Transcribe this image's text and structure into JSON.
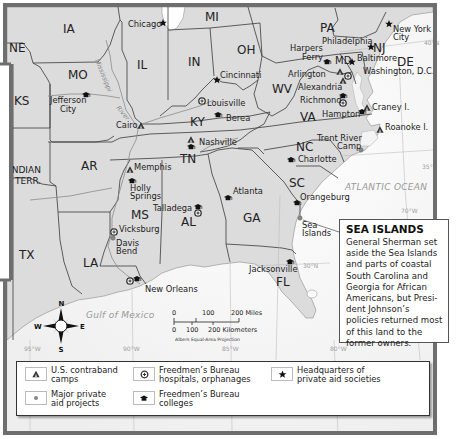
{
  "map": {
    "title_region": "Reconstruction-era South — Freedmen's aid sites",
    "states": [
      {
        "id": "IA",
        "label": "IA",
        "x": 63,
        "y": 33
      },
      {
        "id": "NE",
        "label": "NE",
        "x": 5,
        "y": 52
      },
      {
        "id": "MO",
        "label": "MO",
        "x": 70,
        "y": 79
      },
      {
        "id": "KS",
        "label": "KS",
        "x": 16,
        "y": 105
      },
      {
        "id": "IL",
        "label": "IL",
        "x": 135,
        "y": 69
      },
      {
        "id": "IN",
        "label": "IN",
        "x": 188,
        "y": 66
      },
      {
        "id": "MI",
        "label": "MI",
        "x": 205,
        "y": 21
      },
      {
        "id": "OH",
        "label": "OH",
        "x": 237,
        "y": 53
      },
      {
        "id": "PA",
        "label": "PA",
        "x": 318,
        "y": 32
      },
      {
        "id": "NJ",
        "label": "NJ",
        "x": 373,
        "y": 52
      },
      {
        "id": "MD",
        "label": "MD",
        "x": 333,
        "y": 64
      },
      {
        "id": "DE",
        "label": "DE",
        "x": 397,
        "y": 66
      },
      {
        "id": "WV",
        "label": "WV",
        "x": 272,
        "y": 91
      },
      {
        "id": "VA",
        "label": "VA",
        "x": 300,
        "y": 120
      },
      {
        "id": "KY",
        "label": "KY",
        "x": 190,
        "y": 125
      },
      {
        "id": "TN",
        "label": "TN",
        "x": 178,
        "y": 163
      },
      {
        "id": "NC",
        "label": "NC",
        "x": 295,
        "y": 151
      },
      {
        "id": "SC",
        "label": "SC",
        "x": 287,
        "y": 187
      },
      {
        "id": "AR",
        "label": "AR",
        "x": 82,
        "y": 170
      },
      {
        "id": "MS",
        "label": "MS",
        "x": 130,
        "y": 219
      },
      {
        "id": "AL",
        "label": "AL",
        "x": 180,
        "y": 225
      },
      {
        "id": "GA",
        "label": "GA",
        "x": 241,
        "y": 222
      },
      {
        "id": "FL",
        "label": "FL",
        "x": 275,
        "y": 286
      },
      {
        "id": "LA",
        "label": "LA",
        "x": 84,
        "y": 267
      },
      {
        "id": "TX",
        "label": "TX",
        "x": 19,
        "y": 259
      },
      {
        "id": "INDIAN_TERR",
        "label": "INDIAN",
        "label2": "TERR.",
        "x": 8,
        "y": 173
      }
    ],
    "cities": [
      {
        "name": "Chicago",
        "lines": [
          "Chicago"
        ],
        "x": 128,
        "y": 27,
        "symbol": "star"
      },
      {
        "name": "Cincinnati",
        "lines": [
          "Cincinnati"
        ],
        "x": 219,
        "y": 78,
        "symbol": "star"
      },
      {
        "name": "Louisville",
        "lines": [
          "Louisville"
        ],
        "x": 207,
        "y": 106,
        "symbol": "circle-plus"
      },
      {
        "name": "Berea",
        "lines": [
          "Berea"
        ],
        "x": 225,
        "y": 121,
        "symbol": "mortarboard"
      },
      {
        "name": "Nashville",
        "lines": [
          "Nashville"
        ],
        "x": 199,
        "y": 145,
        "symbol": "triangle"
      },
      {
        "name": "Jefferson City",
        "lines": [
          "Jefferson",
          "City"
        ],
        "x": 50,
        "y": 103,
        "symbol": "mortarboard"
      },
      {
        "name": "Cairo",
        "lines": [
          "Cairo"
        ],
        "x": 117,
        "y": 128,
        "symbol": "triangle"
      },
      {
        "name": "Memphis",
        "lines": [
          "Memphis"
        ],
        "x": 134,
        "y": 170,
        "symbol": "triangle"
      },
      {
        "name": "Holly Springs",
        "lines": [
          "Holly",
          "Springs"
        ],
        "x": 130,
        "y": 190,
        "symbol": "mortarboard"
      },
      {
        "name": "Talladega",
        "lines": [
          "Talladega"
        ],
        "x": 153,
        "y": 211,
        "symbol": "mortarboard-plus"
      },
      {
        "name": "Vicksburg",
        "lines": [
          "Vicksburg"
        ],
        "x": 119,
        "y": 232,
        "symbol": "circle-plus"
      },
      {
        "name": "Davis Bend",
        "lines": [
          "Davis",
          "Bend"
        ],
        "x": 116,
        "y": 246,
        "symbol": "dot"
      },
      {
        "name": "New Orleans",
        "lines": [
          "New Orleans"
        ],
        "x": 145,
        "y": 292,
        "symbol": "circle-plus-mortarboard"
      },
      {
        "name": "Atlanta",
        "lines": [
          "Atlanta"
        ],
        "x": 233,
        "y": 195,
        "symbol": "mortarboard"
      },
      {
        "name": "Orangeburg",
        "lines": [
          "Orangeburg"
        ],
        "x": 299,
        "y": 201,
        "symbol": "mortarboard"
      },
      {
        "name": "Sea Islands",
        "lines": [
          "Sea",
          "Islands"
        ],
        "x": 302,
        "y": 228,
        "symbol": "dot"
      },
      {
        "name": "Charlotte",
        "lines": [
          "Charlotte"
        ],
        "x": 298,
        "y": 162,
        "symbol": "mortarboard"
      },
      {
        "name": "Jacksonville",
        "lines": [
          "Jacksonville"
        ],
        "x": 249,
        "y": 272,
        "symbol": "mortarboard"
      },
      {
        "name": "Trent River Camp",
        "lines": [
          "Trent River",
          "Camp"
        ],
        "x": 317,
        "y": 143,
        "symbol": "dot"
      },
      {
        "name": "Roanoke I.",
        "lines": [
          "Roanoke I."
        ],
        "x": 385,
        "y": 129,
        "symbol": "triangle"
      },
      {
        "name": "Craney I.",
        "lines": [
          "Craney I."
        ],
        "x": 370,
        "y": 108,
        "symbol": "triangle"
      },
      {
        "name": "Hampton",
        "lines": [
          "Hampton"
        ],
        "x": 296,
        "y": 116,
        "symbol": "mortarboard"
      },
      {
        "name": "Richmond",
        "lines": [
          "Richmond"
        ],
        "x": 300,
        "y": 102,
        "symbol": "mortarboard-plus"
      },
      {
        "name": "Alexandria",
        "lines": [
          "Alexandria"
        ],
        "x": 298,
        "y": 89,
        "symbol": "triangle"
      },
      {
        "name": "Arlington",
        "lines": [
          "Arlington"
        ],
        "x": 288,
        "y": 76,
        "symbol": "triangle"
      },
      {
        "name": "Harpers Ferry",
        "lines": [
          "Harpers",
          "Ferry"
        ],
        "x": 290,
        "y": 52,
        "symbol": "mortarboard"
      },
      {
        "name": "Washington, D.C.",
        "lines": [
          "Washington, D.C."
        ],
        "x": 363,
        "y": 74,
        "symbol": "circle-plus"
      },
      {
        "name": "Baltimore",
        "lines": [
          "Baltimore"
        ],
        "x": 357,
        "y": 61,
        "symbol": "star"
      },
      {
        "name": "Philadelphia",
        "lines": [
          "Philadelphia"
        ],
        "x": 322,
        "y": 44,
        "symbol": "star"
      },
      {
        "name": "New York City",
        "lines": [
          "New York",
          "City"
        ],
        "x": 393,
        "y": 32,
        "symbol": "star"
      }
    ],
    "water_labels": [
      {
        "text": "ATLANTIC OCEAN",
        "x": 345,
        "y": 190
      },
      {
        "text": "Gulf of Mexico",
        "x": 86,
        "y": 318
      }
    ],
    "river_label": {
      "line1": "Mississippi",
      "line2": "River"
    },
    "gridlines": [
      {
        "label": "40°N",
        "x": 424,
        "y": 45
      },
      {
        "label": "35°N",
        "x": 422,
        "y": 169
      },
      {
        "label": "30°N",
        "x": 303,
        "y": 268
      },
      {
        "label": "70°W",
        "x": 401,
        "y": 213
      },
      {
        "label": "95°W",
        "x": 24,
        "y": 351
      },
      {
        "label": "90°W",
        "x": 123,
        "y": 351
      },
      {
        "label": "85°W",
        "x": 222,
        "y": 351
      },
      {
        "label": "80°W",
        "x": 330,
        "y": 351
      }
    ],
    "compass": {
      "n": "N",
      "s": "S",
      "e": "E",
      "w": "W"
    },
    "scale": {
      "miles_ticks": [
        "0",
        "100",
        "200 Miles"
      ],
      "km_ticks": [
        "0",
        "100",
        "200 Kilometers"
      ],
      "projection": "Albers Equal-Area Projection"
    }
  },
  "callout": {
    "title": "SEA ISLANDS",
    "body": "General Sherman set aside the Sea Islands and parts of coastal South Carolina and Georgia for African Americans, but Presi-dent Johnson’s policies returned most of this land to the former owners."
  },
  "legend": {
    "items": [
      {
        "symbol": "triangle-icon",
        "label": "U.S. contraband\ncamps"
      },
      {
        "symbol": "dot-icon",
        "label": "Major private\naid projects"
      },
      {
        "symbol": "circle-plus-icon",
        "label": "Freedmen’s Bureau\nhospitals, orphanages"
      },
      {
        "symbol": "mortarboard-icon",
        "label": "Freedmen’s Bureau\ncolleges"
      },
      {
        "symbol": "star-icon",
        "label": "Headquarters of\nprivate aid societies"
      }
    ]
  },
  "colors": {
    "land": "#d9d9d9",
    "land_light": "#e4e4e4",
    "water": "#ffffff",
    "frame": "#6e6e6e",
    "border": "#3a3a3a",
    "river": "#9a9a9a"
  }
}
